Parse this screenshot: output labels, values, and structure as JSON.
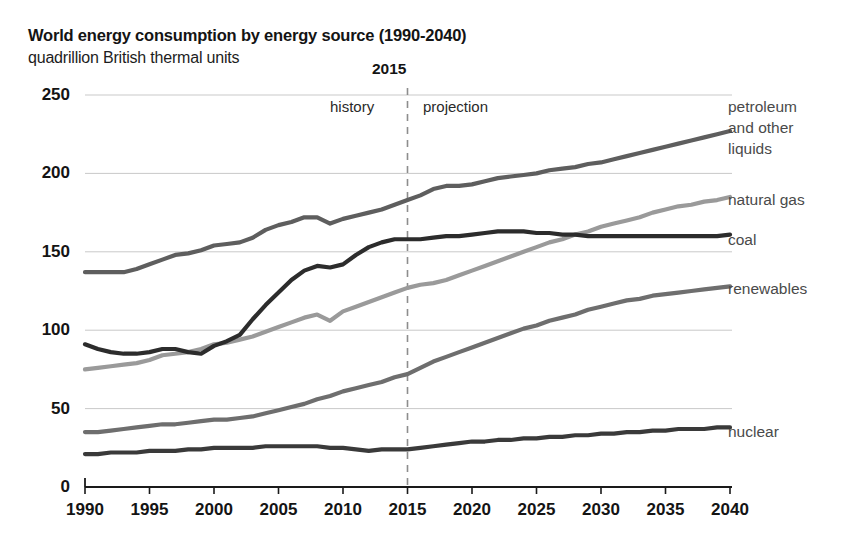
{
  "chart_data": {
    "type": "line",
    "title": "World energy consumption by energy source (1990-2040)",
    "subtitle": "quadrillion British thermal units",
    "ylabel": "quadrillion British thermal units",
    "xlabel": "",
    "xlim": [
      1990,
      2040
    ],
    "ylim": [
      0,
      250
    ],
    "yticks": [
      0,
      50,
      100,
      150,
      200,
      250
    ],
    "xticks": [
      1990,
      1995,
      2000,
      2005,
      2010,
      2015,
      2020,
      2025,
      2030,
      2035,
      2040
    ],
    "grid": "horizontal",
    "legend_position": "right-inline",
    "annotations": {
      "divider_year": "2015",
      "divider_value": 2015,
      "history_label": "history",
      "projection_label": "projection",
      "divider_style": "dashed"
    },
    "x": [
      1990,
      1991,
      1992,
      1993,
      1994,
      1995,
      1996,
      1997,
      1998,
      1999,
      2000,
      2001,
      2002,
      2003,
      2004,
      2005,
      2006,
      2007,
      2008,
      2009,
      2010,
      2011,
      2012,
      2013,
      2014,
      2015,
      2016,
      2017,
      2018,
      2019,
      2020,
      2021,
      2022,
      2023,
      2024,
      2025,
      2026,
      2027,
      2028,
      2029,
      2030,
      2031,
      2032,
      2033,
      2034,
      2035,
      2036,
      2037,
      2038,
      2039,
      2040
    ],
    "series": [
      {
        "name": "petroleum and other liquids",
        "color": "#5e5e5e",
        "values": [
          137,
          137,
          137,
          137,
          139,
          142,
          145,
          148,
          149,
          151,
          154,
          155,
          156,
          159,
          164,
          167,
          169,
          172,
          172,
          168,
          171,
          173,
          175,
          177,
          180,
          183,
          186,
          190,
          192,
          192,
          193,
          195,
          197,
          198,
          199,
          200,
          202,
          203,
          204,
          206,
          207,
          209,
          211,
          213,
          215,
          217,
          219,
          221,
          223,
          225,
          227
        ]
      },
      {
        "name": "natural gas",
        "color": "#9a9a9a",
        "values": [
          75,
          76,
          77,
          78,
          79,
          81,
          84,
          85,
          86,
          88,
          91,
          92,
          94,
          96,
          99,
          102,
          105,
          108,
          110,
          106,
          112,
          115,
          118,
          121,
          124,
          127,
          129,
          130,
          132,
          135,
          138,
          141,
          144,
          147,
          150,
          153,
          156,
          158,
          161,
          163,
          166,
          168,
          170,
          172,
          175,
          177,
          179,
          180,
          182,
          183,
          185
        ]
      },
      {
        "name": "coal",
        "color": "#2c2c2c",
        "values": [
          91,
          88,
          86,
          85,
          85,
          86,
          88,
          88,
          86,
          85,
          90,
          93,
          97,
          107,
          116,
          124,
          132,
          138,
          141,
          140,
          142,
          148,
          153,
          156,
          158,
          158,
          158,
          159,
          160,
          160,
          161,
          162,
          163,
          163,
          163,
          162,
          162,
          161,
          161,
          160,
          160,
          160,
          160,
          160,
          160,
          160,
          160,
          160,
          160,
          160,
          161
        ]
      },
      {
        "name": "renewables",
        "color": "#6e6e6e",
        "values": [
          35,
          35,
          36,
          37,
          38,
          39,
          40,
          40,
          41,
          42,
          43,
          43,
          44,
          45,
          47,
          49,
          51,
          53,
          56,
          58,
          61,
          63,
          65,
          67,
          70,
          72,
          76,
          80,
          83,
          86,
          89,
          92,
          95,
          98,
          101,
          103,
          106,
          108,
          110,
          113,
          115,
          117,
          119,
          120,
          122,
          123,
          124,
          125,
          126,
          127,
          128
        ]
      },
      {
        "name": "nuclear",
        "color": "#3a3a3a",
        "values": [
          21,
          21,
          22,
          22,
          22,
          23,
          23,
          23,
          24,
          24,
          25,
          25,
          25,
          25,
          26,
          26,
          26,
          26,
          26,
          25,
          25,
          24,
          23,
          24,
          24,
          24,
          25,
          26,
          27,
          28,
          29,
          29,
          30,
          30,
          31,
          31,
          32,
          32,
          33,
          33,
          34,
          34,
          35,
          35,
          36,
          36,
          37,
          37,
          37,
          38,
          38
        ]
      }
    ]
  },
  "labels": {
    "petroleum_line1": "petroleum",
    "petroleum_line2": "and other",
    "petroleum_line3": "liquids",
    "natural_gas": "natural gas",
    "coal": "coal",
    "renewables": "renewables",
    "nuclear": "nuclear"
  }
}
